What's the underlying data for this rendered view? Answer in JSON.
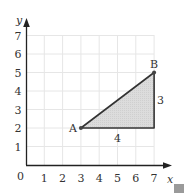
{
  "diagram": {
    "type": "coordinate-grid-triangle",
    "axes": {
      "x_label": "x",
      "y_label": "y",
      "origin_label": "0",
      "x_ticks": [
        "1",
        "2",
        "3",
        "4",
        "5",
        "6",
        "7"
      ],
      "y_ticks": [
        "1",
        "2",
        "3",
        "4",
        "5",
        "6",
        "7"
      ]
    },
    "points": [
      {
        "label": "A",
        "x": 3,
        "y": 2
      },
      {
        "label": "B",
        "x": 7,
        "y": 5
      }
    ],
    "triangle": {
      "vertices": [
        [
          3,
          2
        ],
        [
          7,
          5
        ],
        [
          7,
          2
        ]
      ],
      "fill": "#d9d9d9",
      "stroke": "#333333"
    },
    "side_labels": {
      "horizontal": "4",
      "vertical": "3"
    },
    "colors": {
      "grid": "#e6e6e6",
      "axis": "#333333",
      "corner_tab": "#9a9a9a"
    }
  }
}
